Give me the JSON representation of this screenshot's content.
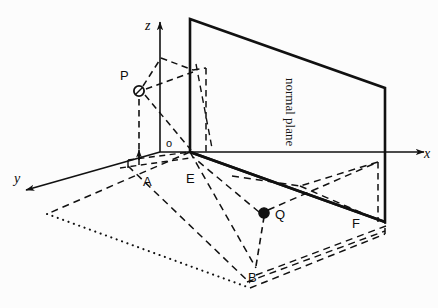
{
  "figure": {
    "background_color": "#fcfcfc",
    "stroke_color": "#111111",
    "axes": {
      "x_label": "x",
      "y_label": "y",
      "z_label": "z",
      "origin_label": "o"
    },
    "points": [
      {
        "id": "P",
        "label": "P",
        "style": "open-circle",
        "x": 139,
        "y": 91
      },
      {
        "id": "Q",
        "label": "Q",
        "style": "filled-circle",
        "x": 264,
        "y": 213
      },
      {
        "id": "A",
        "label": "A",
        "style": "none",
        "x": 139,
        "y": 152
      },
      {
        "id": "B",
        "label": "B",
        "style": "none",
        "x": 256,
        "y": 268
      },
      {
        "id": "E",
        "label": "E",
        "style": "none",
        "x": 190,
        "y": 152
      },
      {
        "id": "F",
        "label": "F",
        "style": "none",
        "x": 385,
        "y": 222
      }
    ],
    "plane": {
      "label": "normal plane",
      "label_rotation_deg": 90
    }
  }
}
